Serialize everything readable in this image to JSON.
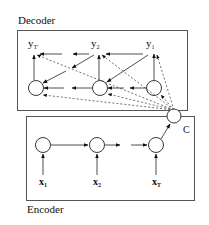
{
  "decoder": {
    "title": "Decoder",
    "outputs": [
      {
        "base": "y",
        "sub": "T'"
      },
      {
        "base": "y",
        "sub": "2"
      },
      {
        "base": "y",
        "sub": "1"
      }
    ]
  },
  "encoder": {
    "title": "Encoder",
    "inputs": [
      {
        "base": "x",
        "sub": "1"
      },
      {
        "base": "x",
        "sub": "2"
      },
      {
        "base": "x",
        "sub": "T"
      }
    ]
  },
  "context": {
    "label": "C"
  },
  "colors": {
    "stroke": "#222222",
    "box": "#555555",
    "background": "#ffffff"
  }
}
